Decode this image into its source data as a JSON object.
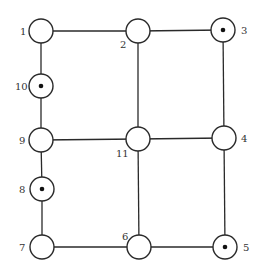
{
  "diagram": {
    "type": "graph",
    "node_radius": 12,
    "colors": {
      "stroke": "#2a2a2a",
      "fill": "#ffffff",
      "dot": "#111111",
      "label": "#333333"
    },
    "nodes": [
      {
        "id": "1",
        "label": "1",
        "x": 41,
        "y": 31,
        "marked": false,
        "label_x": 20,
        "label_y": 35
      },
      {
        "id": "2",
        "label": "2",
        "x": 138,
        "y": 31,
        "marked": false,
        "label_x": 120,
        "label_y": 48
      },
      {
        "id": "3",
        "label": "3",
        "x": 223,
        "y": 30,
        "marked": true,
        "label_x": 241,
        "label_y": 34
      },
      {
        "id": "4",
        "label": "4",
        "x": 224,
        "y": 138,
        "marked": false,
        "label_x": 241,
        "label_y": 142
      },
      {
        "id": "5",
        "label": "5",
        "x": 225,
        "y": 247,
        "marked": true,
        "label_x": 243,
        "label_y": 251
      },
      {
        "id": "6",
        "label": "6",
        "x": 139,
        "y": 247,
        "marked": false,
        "label_x": 122,
        "label_y": 240
      },
      {
        "id": "7",
        "label": "7",
        "x": 42,
        "y": 247,
        "marked": false,
        "label_x": 19,
        "label_y": 251
      },
      {
        "id": "8",
        "label": "8",
        "x": 42,
        "y": 189,
        "marked": true,
        "label_x": 19,
        "label_y": 193
      },
      {
        "id": "9",
        "label": "9",
        "x": 41,
        "y": 140,
        "marked": false,
        "label_x": 19,
        "label_y": 144
      },
      {
        "id": "10",
        "label": "10",
        "x": 41,
        "y": 86,
        "marked": true,
        "label_x": 15,
        "label_y": 90
      },
      {
        "id": "11",
        "label": "11",
        "x": 138,
        "y": 139,
        "marked": false,
        "label_x": 116,
        "label_y": 157
      }
    ],
    "edges": [
      [
        "1",
        "2"
      ],
      [
        "2",
        "3"
      ],
      [
        "1",
        "10"
      ],
      [
        "10",
        "9"
      ],
      [
        "9",
        "8"
      ],
      [
        "8",
        "7"
      ],
      [
        "2",
        "11"
      ],
      [
        "11",
        "6"
      ],
      [
        "3",
        "4"
      ],
      [
        "4",
        "5"
      ],
      [
        "9",
        "11"
      ],
      [
        "11",
        "4"
      ],
      [
        "7",
        "6"
      ],
      [
        "6",
        "5"
      ]
    ]
  }
}
